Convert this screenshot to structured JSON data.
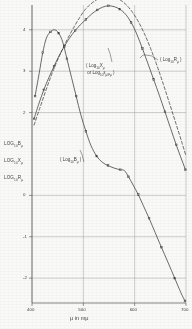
{
  "figure": {
    "kind": "line-chart-scan",
    "background_color": "#fdfdfb",
    "ink_color": "#3a3a38"
  },
  "axis_titles": {
    "x": "μ  in  mμ",
    "y_stack": [
      {
        "base": "LOG",
        "sub": "10",
        "var": "B",
        "varsub": "μ"
      },
      {
        "base": "LOG",
        "sub": "10",
        "var": "X",
        "varsub": "μ"
      },
      {
        "base": "LOG",
        "sub": "10",
        "var": "R",
        "varsub": "μ"
      }
    ]
  },
  "annotations": {
    "x_curve": {
      "line1": "( Log",
      "line1sub": "10",
      "line1b": "X",
      "line1bsub": "μ",
      "line2": "or Log",
      "line2sub": "10",
      "line2b": "ε",
      "line2bsub": "μ/Fμ",
      "close": ")"
    },
    "b_curve": {
      "text": "( Log",
      "sub": "10",
      "var": "B",
      "varsub": "μ",
      "close": " )"
    },
    "r_curve": {
      "text": "( Log",
      "sub": "10",
      "var": "R",
      "varsub": "μ",
      "close": " )"
    }
  },
  "chart_data": {
    "type": "line",
    "title": "",
    "xlabel": "μ  in  mμ",
    "ylabel": "LOG10 Bμ / LOG10 Xμ / LOG10 Rμ",
    "xlim": [
      400,
      700
    ],
    "ylim": [
      -2.6,
      4.6
    ],
    "xticks": [
      400,
      500,
      600,
      700
    ],
    "yticks": [
      4,
      3,
      2,
      0,
      -1,
      -2
    ],
    "ytick_labels": [
      "4",
      "3",
      "2",
      "0",
      "-1",
      "-2"
    ],
    "grid": true,
    "legend": "inline-annotations",
    "series": [
      {
        "name": "Log10 Bμ",
        "style": "solid-with-markers",
        "marker": "square",
        "annotation": "( Log10 Bμ )",
        "points": [
          [
            406,
            2.4
          ],
          [
            414,
            2.95
          ],
          [
            421,
            3.45
          ],
          [
            428,
            3.8
          ],
          [
            436,
            3.95
          ],
          [
            444,
            4.0
          ],
          [
            452,
            3.92
          ],
          [
            460,
            3.7
          ],
          [
            468,
            3.3
          ],
          [
            477,
            2.85
          ],
          [
            486,
            2.4
          ],
          [
            495,
            1.95
          ],
          [
            505,
            1.55
          ],
          [
            515,
            1.2
          ],
          [
            526,
            0.95
          ],
          [
            537,
            0.8
          ],
          [
            548,
            0.72
          ],
          [
            560,
            0.66
          ],
          [
            572,
            0.62
          ],
          [
            580,
            0.6
          ],
          [
            588,
            0.45
          ],
          [
            597,
            0.25
          ],
          [
            607,
            0.02
          ],
          [
            617,
            -0.25
          ],
          [
            628,
            -0.55
          ],
          [
            640,
            -0.9
          ],
          [
            652,
            -1.25
          ],
          [
            665,
            -1.62
          ],
          [
            678,
            -2.0
          ],
          [
            690,
            -2.35
          ],
          [
            698,
            -2.55
          ]
        ]
      },
      {
        "name": "Log10 Xμ",
        "style": "solid-with-markers",
        "marker": "square",
        "annotation": "( Log10 Xμ  or  Log10 εμ/Fμ )",
        "points": [
          [
            404,
            1.85
          ],
          [
            413,
            2.2
          ],
          [
            423,
            2.55
          ],
          [
            433,
            2.85
          ],
          [
            443,
            3.12
          ],
          [
            453,
            3.38
          ],
          [
            463,
            3.6
          ],
          [
            473,
            3.8
          ],
          [
            484,
            3.98
          ],
          [
            494,
            4.12
          ],
          [
            505,
            4.25
          ],
          [
            516,
            4.38
          ],
          [
            527,
            4.48
          ],
          [
            538,
            4.55
          ],
          [
            549,
            4.58
          ],
          [
            560,
            4.56
          ],
          [
            571,
            4.5
          ],
          [
            582,
            4.38
          ],
          [
            593,
            4.18
          ],
          [
            604,
            3.9
          ],
          [
            615,
            3.55
          ],
          [
            626,
            3.18
          ],
          [
            637,
            2.8
          ],
          [
            648,
            2.42
          ],
          [
            659,
            2.02
          ],
          [
            670,
            1.62
          ],
          [
            681,
            1.22
          ],
          [
            692,
            0.85
          ],
          [
            699,
            0.62
          ]
        ]
      },
      {
        "name": "Log10 Rμ",
        "style": "dashed",
        "marker": "none",
        "annotation": "( Log10 Rμ )",
        "points": [
          [
            404,
            1.7
          ],
          [
            415,
            2.1
          ],
          [
            426,
            2.5
          ],
          [
            437,
            2.88
          ],
          [
            448,
            3.22
          ],
          [
            459,
            3.52
          ],
          [
            470,
            3.8
          ],
          [
            481,
            4.05
          ],
          [
            492,
            4.28
          ],
          [
            503,
            4.48
          ],
          [
            514,
            4.62
          ],
          [
            525,
            4.72
          ],
          [
            536,
            4.78
          ],
          [
            548,
            4.8
          ],
          [
            560,
            4.78
          ],
          [
            572,
            4.72
          ],
          [
            584,
            4.6
          ],
          [
            596,
            4.42
          ],
          [
            608,
            4.18
          ],
          [
            620,
            3.88
          ],
          [
            632,
            3.52
          ],
          [
            644,
            3.12
          ],
          [
            656,
            2.68
          ],
          [
            668,
            2.22
          ],
          [
            680,
            1.75
          ],
          [
            692,
            1.28
          ],
          [
            700,
            0.95
          ]
        ]
      }
    ]
  }
}
